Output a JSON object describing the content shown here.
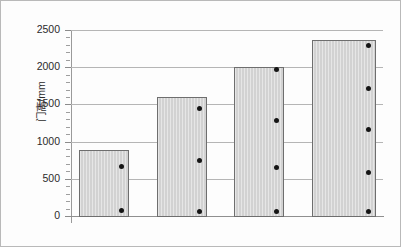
{
  "chart_data": {
    "type": "bar",
    "title": "",
    "xlabel": "",
    "ylabel": "门高/mm",
    "ylim": [
      0,
      2500
    ],
    "ytick_labels": [
      "0",
      "500",
      "1000",
      "1500",
      "2000",
      "2500"
    ],
    "ytick_values": [
      0,
      500,
      1000,
      1500,
      2000,
      2500
    ],
    "minor_tick_interval": 100,
    "grid": "horizontal",
    "legend": "none",
    "categories": [
      "1",
      "2",
      "3",
      "4"
    ],
    "values": [
      890,
      1600,
      2000,
      2370
    ],
    "series": [
      {
        "name": "bar-heights",
        "values": [
          890,
          1600,
          2000,
          2370
        ]
      },
      {
        "name": "scatter-points",
        "points": [
          [
            70,
            660
          ],
          [
            60,
            750,
            1440
          ],
          [
            60,
            650,
            1280,
            1970
          ],
          [
            60,
            590,
            1160,
            1720,
            2290
          ]
        ]
      }
    ],
    "bar_color": "#d2d2d2",
    "bar_border_color": "#6e6e6e",
    "point_color": "#151515",
    "grid_color": "#b5b5b5",
    "axis_color": "#8f8f8f",
    "frame_color": "#b9b9b9",
    "background": "#fdfdfd"
  },
  "geometry": {
    "plot_left": 70,
    "plot_top": 29,
    "plot_width": 312,
    "plot_height": 186,
    "bars": [
      {
        "left": 78,
        "width": 50
      },
      {
        "left": 156,
        "width": 50
      },
      {
        "left": 233,
        "width": 50
      },
      {
        "left": 311,
        "width": 64
      }
    ]
  }
}
